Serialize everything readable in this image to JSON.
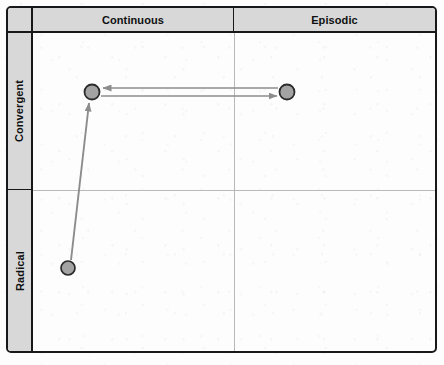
{
  "figure": {
    "name": "innovation-matrix",
    "columns": [
      {
        "id": "continuous",
        "label": "Continuous"
      },
      {
        "id": "episodic",
        "label": "Episodic"
      }
    ],
    "rows": [
      {
        "id": "convergent",
        "label": "Convergent"
      },
      {
        "id": "radical",
        "label": "Radical"
      }
    ],
    "corner_label": ""
  },
  "chart_data": {
    "type": "scatter",
    "title": "",
    "xlabel": "",
    "ylabel": "",
    "x_categories": [
      "Continuous",
      "Episodic"
    ],
    "y_categories": [
      "Convergent",
      "Radical"
    ],
    "grid": true,
    "legend": "none",
    "points": [
      {
        "id": "point-convergent-continuous",
        "x_category": "Continuous",
        "y_category": "Convergent",
        "cx": 92,
        "cy": 92,
        "r": 7.5,
        "fill": "#a3a3a3",
        "stroke": "#2b2b2b"
      },
      {
        "id": "point-convergent-episodic",
        "x_category": "Episodic",
        "y_category": "Convergent",
        "cx": 287,
        "cy": 92,
        "r": 7.5,
        "fill": "#a3a3a3",
        "stroke": "#2b2b2b"
      },
      {
        "id": "point-radical-continuous",
        "x_category": "Continuous",
        "y_category": "Radical",
        "cx": 68,
        "cy": 268,
        "r": 7,
        "fill": "#a3a3a3",
        "stroke": "#2b2b2b"
      }
    ],
    "arrows": [
      {
        "id": "arrow-episodic-to-continuous",
        "from": "point-convergent-episodic",
        "to": "point-convergent-continuous",
        "direction": "left",
        "x1": 278,
        "y1": 88,
        "x2": 103,
        "y2": 88
      },
      {
        "id": "arrow-continuous-to-episodic",
        "from": "point-convergent-continuous",
        "to": "point-convergent-episodic",
        "direction": "right",
        "x1": 101,
        "y1": 96,
        "x2": 277,
        "y2": 96
      },
      {
        "id": "arrow-radical-to-convergent",
        "from": "point-radical-continuous",
        "to": "point-convergent-continuous",
        "direction": "up",
        "x1": 71,
        "y1": 260,
        "x2": 89,
        "y2": 103
      }
    ],
    "colors": {
      "marker_fill": "#a3a3a3",
      "marker_stroke": "#2b2b2b",
      "arrow": "#8c8c8c",
      "header_band": "#d8d8d8",
      "frame": "#17181a",
      "gridline": "#b9b9b9"
    }
  }
}
